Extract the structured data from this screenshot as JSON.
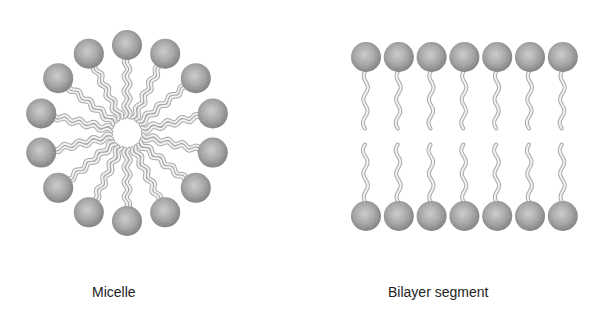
{
  "figure": {
    "micelle": {
      "label": "Micelle",
      "center": [
        127,
        133
      ],
      "head_count": 14,
      "head_orbit_radius": 88,
      "core_radius": 14,
      "head_radius": 15
    },
    "bilayer": {
      "label": "Bilayer segment",
      "head_count_per_leaflet": 7,
      "x_start": 366,
      "x_step": 32.8,
      "top_y": 57,
      "bottom_y": 216,
      "head_radius": 15
    },
    "colors": {
      "head_edge": "#7a7a7a",
      "head_center": "#c4c4c4",
      "tail_stroke": "#a8a8a8",
      "tail_fill": "#f2f2f2",
      "label_text": "#222222"
    }
  }
}
